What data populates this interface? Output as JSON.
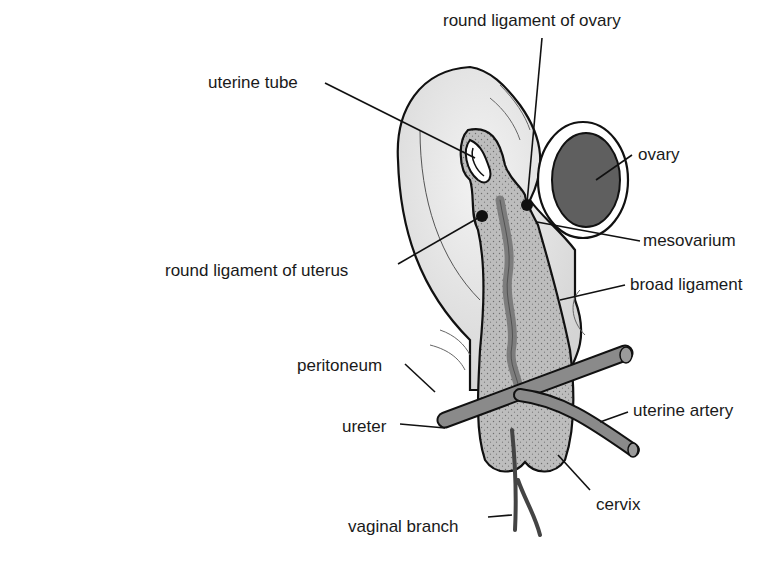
{
  "diagram": {
    "labels": [
      {
        "id": "round-ligament-ovary",
        "text": "round ligament of ovary",
        "x": 443,
        "y": 12
      },
      {
        "id": "uterine-tube",
        "text": "uterine tube",
        "x": 208,
        "y": 74
      },
      {
        "id": "ovary",
        "text": "ovary",
        "x": 638,
        "y": 146
      },
      {
        "id": "mesovarium",
        "text": "mesovarium",
        "x": 643,
        "y": 232
      },
      {
        "id": "round-ligament-uterus",
        "text": "round ligament of uterus",
        "x": 165,
        "y": 262
      },
      {
        "id": "broad-ligament",
        "text": "broad ligament",
        "x": 630,
        "y": 276
      },
      {
        "id": "peritoneum",
        "text": "peritoneum",
        "x": 297,
        "y": 357
      },
      {
        "id": "uterine-artery",
        "text": "uterine artery",
        "x": 633,
        "y": 402
      },
      {
        "id": "ureter",
        "text": "ureter",
        "x": 342,
        "y": 418
      },
      {
        "id": "cervix",
        "text": "cervix",
        "x": 596,
        "y": 496
      },
      {
        "id": "vaginal-branch",
        "text": "vaginal branch",
        "x": 348,
        "y": 518
      }
    ],
    "colors": {
      "background": "#ffffff",
      "broad_ligament_fill": "#e3e3e3",
      "uterus_stipple": "#b9b9b9",
      "vessel": "#8a8a8a",
      "ovary_fill": "#5f5f5f",
      "outline": "#111111",
      "text": "#1a1a1a"
    }
  }
}
